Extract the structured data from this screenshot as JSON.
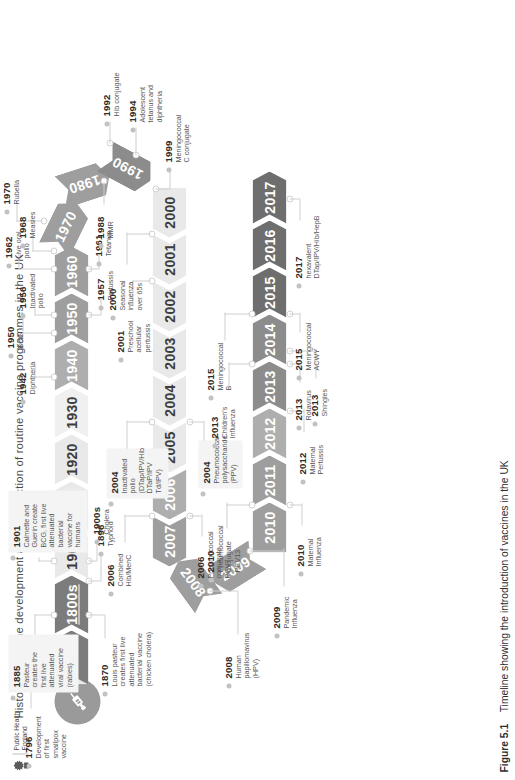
{
  "header": {
    "title": "Historical vaccine development and introduction of routine vaccine programmes in the UK",
    "logo": {
      "line1": "Public Health",
      "line2": "England",
      "icon": "royal-crest-icon"
    }
  },
  "caption": {
    "figure_number": "Figure 5.1",
    "text": "Timeline showing the introduction of vaccines in the UK"
  },
  "badge": {
    "icon": "syringe-icon"
  },
  "timeline": {
    "segments": [
      {
        "label": "1700s",
        "tone": "dark"
      },
      {
        "label": "1800s",
        "tone": "dark",
        "underline": true
      },
      {
        "label": "1900",
        "tone": "light"
      },
      {
        "label": "1910",
        "tone": "light"
      },
      {
        "label": "1920",
        "tone": "light"
      },
      {
        "label": "1930",
        "tone": "light2"
      },
      {
        "label": "1940",
        "tone": "mid2"
      },
      {
        "label": "1950",
        "tone": "mid"
      },
      {
        "label": "1960",
        "tone": "mid"
      },
      {
        "label": "1970",
        "tone": "mid"
      },
      {
        "label": "1980",
        "tone": "mid"
      },
      {
        "label": "1990",
        "tone": "dark2"
      },
      {
        "label": "2000",
        "tone": "light"
      },
      {
        "label": "2001",
        "tone": "light"
      },
      {
        "label": "2002",
        "tone": "light"
      },
      {
        "label": "2003",
        "tone": "light"
      },
      {
        "label": "2004",
        "tone": "light"
      },
      {
        "label": "2005",
        "tone": "light"
      },
      {
        "label": "2006",
        "tone": "mid2"
      },
      {
        "label": "2007",
        "tone": "mid"
      },
      {
        "label": "2008",
        "tone": "mid"
      },
      {
        "label": "2009",
        "tone": "mid"
      },
      {
        "label": "2010",
        "tone": "mid"
      },
      {
        "label": "2011",
        "tone": "mid"
      },
      {
        "label": "2012",
        "tone": "mid2"
      },
      {
        "label": "2013",
        "tone": "dark2"
      },
      {
        "label": "2014",
        "tone": "dark2"
      },
      {
        "label": "2015",
        "tone": "vdark"
      },
      {
        "label": "2016",
        "tone": "vdark"
      },
      {
        "label": "2017",
        "tone": "vdark"
      }
    ]
  },
  "events": [
    {
      "id": "e1796",
      "year": "1796",
      "text": "Development of first smallpox vaccine"
    },
    {
      "id": "e1870",
      "year": "1870",
      "text": "Louis pasteur creates first live attenuated bacterial vaccine (chicken cholera)"
    },
    {
      "id": "e1885",
      "year": "1885",
      "text": "Pasteur creates the first live attenuated viral vaccine (rabies)"
    },
    {
      "id": "e1896",
      "year": "1896",
      "text": "Typhoid"
    },
    {
      "id": "e1900s",
      "year": "1900s",
      "text": "Cholera"
    },
    {
      "id": "e1901",
      "year": "1901",
      "text": "Calmette and Guerin create BCG, first live attenuated bacterial vaccine for humans"
    },
    {
      "id": "e1942",
      "year": "1942",
      "text": "Diphtheria"
    },
    {
      "id": "e1950",
      "year": "1950",
      "text": "BCG"
    },
    {
      "id": "e1956",
      "year": "1956",
      "text": "Inactivated polio"
    },
    {
      "id": "e1957",
      "year": "1957",
      "text": "Pertussis"
    },
    {
      "id": "e1961",
      "year": "1961",
      "text": "Tetanus"
    },
    {
      "id": "e1962",
      "year": "1962",
      "text": "Live oral polio"
    },
    {
      "id": "e1968",
      "year": "1968",
      "text": "Measles"
    },
    {
      "id": "e1970",
      "year": "1970",
      "text": "Rubella"
    },
    {
      "id": "e1988",
      "year": "1988",
      "text": "MMR"
    },
    {
      "id": "e1992",
      "year": "1992",
      "text": "Hib conjugate"
    },
    {
      "id": "e1994",
      "year": "1994",
      "text": "Adolescent tetanus and diphtheria"
    },
    {
      "id": "e1999",
      "year": "1999",
      "text": "Meningococcal C conjugate"
    },
    {
      "id": "e2000",
      "year": "2000",
      "text": "Seasonal influenza over 65s"
    },
    {
      "id": "e2001",
      "year": "2001",
      "text": "Preschool acellular pertussis"
    },
    {
      "id": "e2004",
      "year": "2004",
      "text": "Inactivated polio (DTap/IPV/Hib DTaP/IPV Td/IPV)"
    },
    {
      "id": "e2004b",
      "year": "2004",
      "text": "Pneumococcal polysaccharide (PPV)"
    },
    {
      "id": "e2006",
      "year": "2006",
      "text": "Combined Hib/MenC"
    },
    {
      "id": "e2006b",
      "year": "2006",
      "text": "Pneumococcal conjugate PCV7"
    },
    {
      "id": "e2008",
      "year": "2008",
      "text": "Human papillomavirus (HPV)"
    },
    {
      "id": "e2009",
      "year": "2009",
      "text": "Pandemic Influenza"
    },
    {
      "id": "e2010",
      "year": "2010",
      "text": "Pneumococcal conjugate PCV13"
    },
    {
      "id": "e2010b",
      "year": "2010",
      "text": "Maternal Influenza"
    },
    {
      "id": "e2012",
      "year": "2012",
      "text": "Maternal Pertussis"
    },
    {
      "id": "e2013",
      "year": "2013",
      "text": "Children's Influenza"
    },
    {
      "id": "e2013b",
      "year": "2013",
      "text": "Rotavirus"
    },
    {
      "id": "e2013c",
      "year": "2013",
      "text": "Shingles"
    },
    {
      "id": "e2015",
      "year": "2015",
      "text": "Meningococcal B"
    },
    {
      "id": "e2015b",
      "year": "2015",
      "text": "Meningococcal ACWY"
    },
    {
      "id": "e2017",
      "year": "2017",
      "text": "hexavalent DTap/IPV/Hib/HepB"
    }
  ],
  "colors": {
    "light_chevron": "#e9e9e9",
    "mid_chevron": "#9e9e9e",
    "dark_chevron": "#7c7c7c",
    "very_dark_chevron": "#6e6e6e",
    "annotation_box": "#f4f4f4",
    "connector": "#cfcfcf",
    "text": "#3b3b3b"
  }
}
